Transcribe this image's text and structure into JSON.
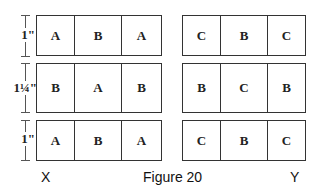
{
  "figure": {
    "caption": "Figure 20",
    "left_label": "X",
    "right_label": "Y"
  },
  "dimensions": [
    "1\"",
    "1¼\"",
    "1\""
  ],
  "block_x": {
    "rows": [
      [
        "A",
        "B",
        "A"
      ],
      [
        "B",
        "A",
        "B"
      ],
      [
        "A",
        "B",
        "A"
      ]
    ]
  },
  "block_y": {
    "rows": [
      [
        "C",
        "B",
        "C"
      ],
      [
        "B",
        "C",
        "B"
      ],
      [
        "C",
        "B",
        "C"
      ]
    ]
  },
  "colors": {
    "border": "#333333",
    "text": "#222222",
    "background": "#ffffff"
  }
}
